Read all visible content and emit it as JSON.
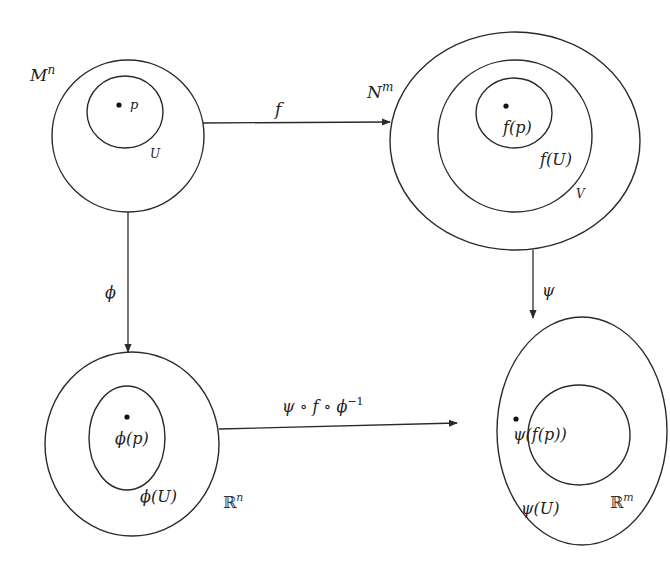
{
  "diagram": {
    "nodes": {
      "M": {
        "label": "M",
        "sup": "n",
        "point_label": "p",
        "subset_label": "U"
      },
      "N": {
        "label": "N",
        "sup": "m",
        "point_label": "f(p)",
        "subset_label": "f(U)",
        "chart_domain_label": "V"
      },
      "Rn": {
        "label": "ℝ",
        "sup": "n",
        "point_label": "ϕ(p)",
        "subset_label": "ϕ(U)"
      },
      "Rm": {
        "label": "ℝ",
        "sup": "m",
        "point_label": "ψ(f(p))",
        "subset_label": "ψ(U)"
      }
    },
    "edges": [
      {
        "from": "M",
        "to": "N",
        "label": "f"
      },
      {
        "from": "M",
        "to": "Rn",
        "label": "ϕ"
      },
      {
        "from": "N",
        "to": "Rm",
        "label": "ψ"
      },
      {
        "from": "Rn",
        "to": "Rm",
        "label": "ψ ∘ f ∘ ϕ",
        "label_sup": "−1"
      }
    ]
  }
}
